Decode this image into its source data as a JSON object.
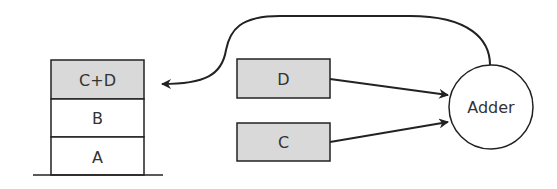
{
  "stack": {
    "cells": [
      {
        "label": "C+D",
        "fill": "#d9d9d9"
      },
      {
        "label": "B",
        "fill": "#ffffff"
      },
      {
        "label": "A",
        "fill": "#ffffff"
      }
    ]
  },
  "inputs": {
    "d": {
      "label": "D",
      "fill": "#d9d9d9"
    },
    "c": {
      "label": "C",
      "fill": "#d9d9d9"
    }
  },
  "adder": {
    "label": "Adder"
  },
  "colors": {
    "stroke": "#222222",
    "shaded": "#d9d9d9"
  }
}
